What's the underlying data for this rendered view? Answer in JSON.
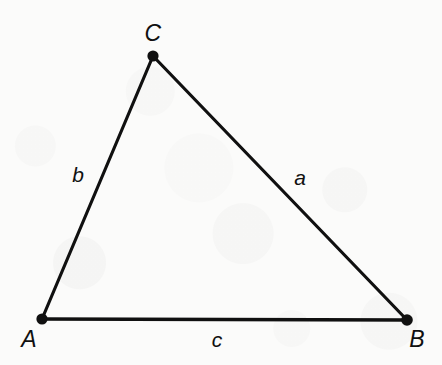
{
  "figure": {
    "kind": "geometry-diagram",
    "width": 442,
    "height": 365,
    "background_color": "#fbfbfa",
    "stroke_color": "#101010",
    "stroke_width": 3.2,
    "vertex_dot_radius": 5.6,
    "vertices": [
      {
        "id": "A",
        "label": "A",
        "x": 42,
        "y": 319,
        "label_x": 29,
        "label_y": 339
      },
      {
        "id": "B",
        "label": "B",
        "x": 407,
        "y": 320,
        "label_x": 417,
        "label_y": 339
      },
      {
        "id": "C",
        "label": "C",
        "x": 153,
        "y": 56,
        "label_x": 153,
        "label_y": 33
      }
    ],
    "sides": [
      {
        "id": "a",
        "label": "a",
        "from": "B",
        "to": "C",
        "label_x": 300,
        "label_y": 177
      },
      {
        "id": "b",
        "label": "b",
        "from": "A",
        "to": "C",
        "label_x": 78,
        "label_y": 174
      },
      {
        "id": "c",
        "label": "c",
        "from": "A",
        "to": "B",
        "label_x": 217,
        "label_y": 339
      }
    ]
  }
}
